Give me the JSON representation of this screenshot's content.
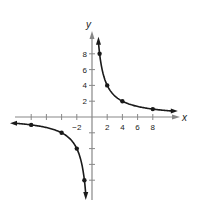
{
  "chart_data": {
    "type": "line",
    "title": "",
    "xlabel": "x",
    "ylabel": "y",
    "xlim": [
      -10,
      10
    ],
    "ylim": [
      -10,
      10
    ],
    "grid": false,
    "x_ticks": [
      -8,
      -6,
      -4,
      -2,
      2,
      4,
      6,
      8
    ],
    "x_tick_labels": [
      "-2",
      "2",
      "4",
      "6",
      "8"
    ],
    "x_tick_label_values": [
      -2,
      2,
      4,
      6,
      8
    ],
    "y_ticks": [
      -8,
      -6,
      -4,
      -2,
      2,
      4,
      6,
      8
    ],
    "y_tick_labels": [
      "2",
      "4",
      "6",
      "8"
    ],
    "y_tick_label_values": [
      2,
      4,
      6,
      8
    ],
    "series": [
      {
        "name": "right branch",
        "points": [
          [
            1,
            8
          ],
          [
            2,
            4
          ],
          [
            4,
            2
          ],
          [
            8,
            1
          ]
        ]
      },
      {
        "name": "left branch",
        "points": [
          [
            -8,
            -1
          ],
          [
            -4,
            -2
          ],
          [
            -2,
            -4
          ],
          [
            -1,
            -8
          ]
        ]
      }
    ],
    "function": "y = 8/x",
    "colors": {
      "curve": "#1a1a1a",
      "axis": "#888888",
      "points": "#1a1a1a"
    }
  }
}
